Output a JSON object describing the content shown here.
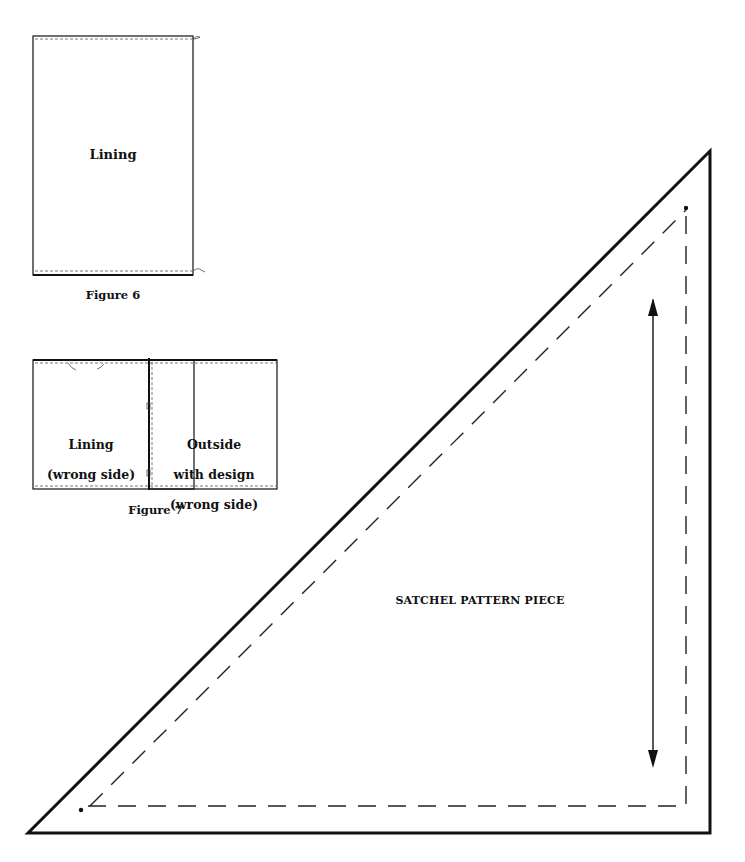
{
  "figure6": {
    "label": "Lining",
    "caption": "Figure 6"
  },
  "figure7": {
    "left_label_line1": "Lining",
    "left_label_line2": "(wrong side)",
    "right_label_line1": "Outside",
    "right_label_line2": "with design",
    "right_label_line3": "(wrong side)",
    "caption": "Figure 7"
  },
  "pattern": {
    "title": "SATCHEL PATTERN PIECE",
    "grainline": "double-headed-arrow"
  }
}
